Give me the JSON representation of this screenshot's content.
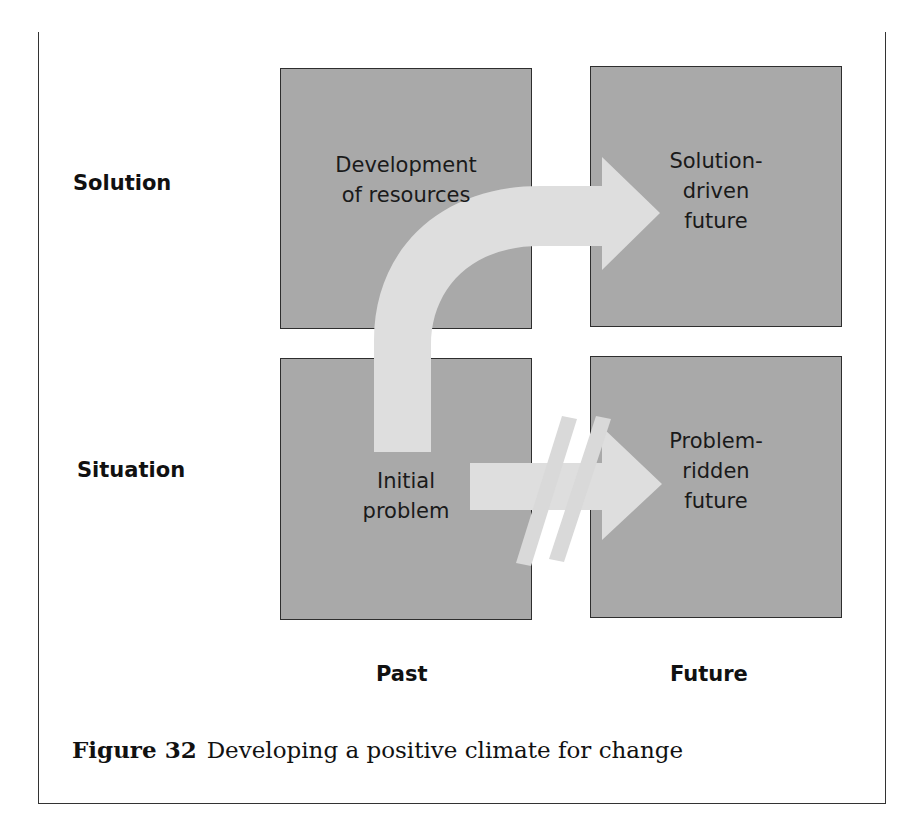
{
  "figure": {
    "number": "Figure 32",
    "caption": "Developing a positive climate for change"
  },
  "row_labels": {
    "top": "Solution",
    "bottom": "Situation"
  },
  "column_labels": {
    "left": "Past",
    "right": "Future"
  },
  "boxes": {
    "top_left": {
      "line1": "Development",
      "line2": "of resources"
    },
    "top_right": {
      "line1": "Solution-",
      "line2": "driven",
      "line3": "future"
    },
    "bottom_left": {
      "line1": "Initial",
      "line2": "problem"
    },
    "bottom_right": {
      "line1": "Problem-",
      "line2": "ridden",
      "line3": "future"
    }
  },
  "arrows": {
    "curved": "Initial problem to Solution-driven future",
    "blocked": "Initial problem to Problem-ridden future (crossed out)"
  },
  "colors": {
    "box_fill": "#a9a9a9",
    "box_border": "#2e2e2e",
    "arrow_fill": "#dedede"
  }
}
